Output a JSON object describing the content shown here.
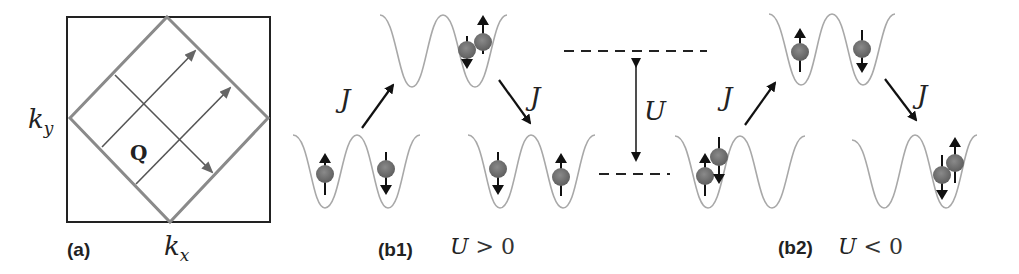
{
  "panels": {
    "a": {
      "label": "(a)",
      "xaxis": "k",
      "xaxis_sub": "x",
      "yaxis": "k",
      "yaxis_sub": "y",
      "vector_label": "Q"
    },
    "b1": {
      "label": "(b1)",
      "condition_var": "U",
      "condition_rel": " > 0",
      "hop_label_left": "J",
      "hop_label_right": "J"
    },
    "energy_scale": {
      "label": "U"
    },
    "b2": {
      "label": "(b2)",
      "condition_var": "U",
      "condition_rel": " < 0",
      "hop_label_left": "J",
      "hop_label_right": "J"
    }
  },
  "colors": {
    "box": "#222222",
    "diamond": "#8a8a8a",
    "grid": "#555555",
    "well": "#a8a8a8",
    "particle": "#6e6e6e",
    "arrow": "#111111"
  },
  "wells": {
    "b1_top": {
      "spins": [
        {
          "site": "right",
          "dir": "up_down_pair"
        }
      ]
    },
    "b1_left": {
      "spins": [
        {
          "site": "left",
          "dir": "up"
        },
        {
          "site": "right",
          "dir": "down"
        }
      ]
    },
    "b1_right": {
      "spins": [
        {
          "site": "left",
          "dir": "down"
        },
        {
          "site": "right",
          "dir": "up"
        }
      ]
    },
    "b2_top": {
      "spins": [
        {
          "site": "left",
          "dir": "up"
        },
        {
          "site": "right",
          "dir": "down"
        }
      ]
    },
    "b2_left": {
      "spins": [
        {
          "site": "left",
          "dir": "up_down_pair"
        }
      ]
    },
    "b2_right": {
      "spins": [
        {
          "site": "right",
          "dir": "up_down_pair"
        }
      ]
    }
  }
}
